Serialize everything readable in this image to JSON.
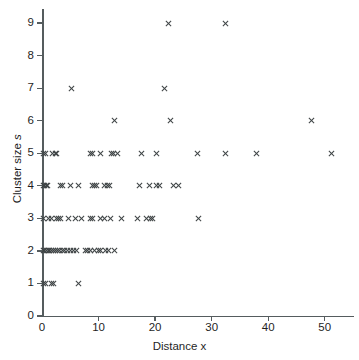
{
  "chart_data": {
    "type": "scatter",
    "title": "",
    "xlabel": "Distance x",
    "ylabel": "Cluster size s",
    "xlim": [
      0,
      55
    ],
    "ylim": [
      0,
      9.5
    ],
    "xticks": [
      0,
      10,
      20,
      30,
      40,
      50
    ],
    "yticks": [
      0,
      1,
      2,
      3,
      4,
      5,
      6,
      7,
      8,
      9
    ],
    "grid": false,
    "legend": null,
    "marker": "x",
    "marker_color": "#3f4446",
    "axis_color": "#555c5e",
    "series": [
      {
        "name": "cluster observations",
        "points": [
          [
            0.3,
            1
          ],
          [
            0.7,
            1
          ],
          [
            1.6,
            1
          ],
          [
            2.1,
            1
          ],
          [
            6.5,
            1
          ],
          [
            0.2,
            2
          ],
          [
            0.5,
            2
          ],
          [
            0.8,
            2
          ],
          [
            1.1,
            2
          ],
          [
            1.4,
            2
          ],
          [
            1.7,
            2
          ],
          [
            2.0,
            2
          ],
          [
            2.3,
            2
          ],
          [
            2.7,
            2
          ],
          [
            3.1,
            2
          ],
          [
            3.6,
            2
          ],
          [
            4.0,
            2
          ],
          [
            4.5,
            2
          ],
          [
            5.0,
            2
          ],
          [
            5.5,
            2
          ],
          [
            6.1,
            2
          ],
          [
            7.7,
            2
          ],
          [
            8.1,
            2
          ],
          [
            8.6,
            2
          ],
          [
            9.2,
            2
          ],
          [
            10.0,
            2
          ],
          [
            10.4,
            2
          ],
          [
            11.2,
            2
          ],
          [
            11.7,
            2
          ],
          [
            12.8,
            2
          ],
          [
            0.2,
            3
          ],
          [
            1.1,
            3
          ],
          [
            1.6,
            3
          ],
          [
            2.6,
            3
          ],
          [
            2.9,
            3
          ],
          [
            3.2,
            3
          ],
          [
            4.6,
            3
          ],
          [
            5.9,
            3
          ],
          [
            6.9,
            3
          ],
          [
            8.6,
            3
          ],
          [
            8.9,
            3
          ],
          [
            10.4,
            3
          ],
          [
            11.1,
            3
          ],
          [
            12.2,
            3
          ],
          [
            14.0,
            3
          ],
          [
            16.8,
            3
          ],
          [
            18.5,
            3
          ],
          [
            19.2,
            3
          ],
          [
            19.6,
            3
          ],
          [
            27.7,
            3
          ],
          [
            0.2,
            4
          ],
          [
            0.5,
            4
          ],
          [
            0.8,
            4
          ],
          [
            1.0,
            4
          ],
          [
            3.3,
            4
          ],
          [
            3.6,
            4
          ],
          [
            5.0,
            4
          ],
          [
            6.5,
            4
          ],
          [
            8.9,
            4
          ],
          [
            9.3,
            4
          ],
          [
            9.7,
            4
          ],
          [
            11.0,
            4
          ],
          [
            11.5,
            4
          ],
          [
            12.0,
            4
          ],
          [
            17.3,
            4
          ],
          [
            19.0,
            4
          ],
          [
            20.3,
            4
          ],
          [
            20.8,
            4
          ],
          [
            23.3,
            4
          ],
          [
            24.1,
            4
          ],
          [
            0.2,
            5
          ],
          [
            0.6,
            5
          ],
          [
            1.8,
            5
          ],
          [
            2.3,
            5
          ],
          [
            2.6,
            5
          ],
          [
            8.6,
            5
          ],
          [
            9.0,
            5
          ],
          [
            10.3,
            5
          ],
          [
            12.3,
            5
          ],
          [
            12.7,
            5
          ],
          [
            13.3,
            5
          ],
          [
            17.6,
            5
          ],
          [
            20.3,
            5
          ],
          [
            27.5,
            5
          ],
          [
            32.4,
            5
          ],
          [
            38.0,
            5
          ],
          [
            51.2,
            5
          ],
          [
            12.9,
            6
          ],
          [
            22.7,
            6
          ],
          [
            47.6,
            6
          ],
          [
            5.2,
            7
          ],
          [
            21.6,
            7
          ],
          [
            22.4,
            9
          ],
          [
            32.4,
            9
          ]
        ]
      }
    ]
  },
  "axis": {
    "x_title": "Distance x",
    "y_title_prefix": "Cluster size ",
    "y_title_italic": "s",
    "x_tick_labels": [
      "0",
      "10",
      "20",
      "30",
      "40",
      "50"
    ],
    "y_tick_labels": [
      "0",
      "1",
      "2",
      "3",
      "4",
      "5",
      "6",
      "7",
      "8",
      "9"
    ]
  },
  "caption": {
    "text": ""
  }
}
